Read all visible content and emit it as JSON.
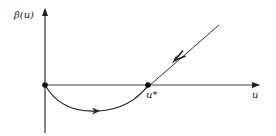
{
  "figure": {
    "type": "phase-diagram",
    "y_axis_label": "β(u)",
    "x_axis_label": "u",
    "fixed_point_label": "u*",
    "color": "#222222",
    "elements": [
      {
        "name": "origin-fixed-point",
        "kind": "dot",
        "at": "origin"
      },
      {
        "name": "u-star-fixed-point",
        "kind": "dot",
        "at": "u*"
      },
      {
        "name": "lower-trajectory",
        "kind": "curve",
        "from": "origin",
        "to": "u*",
        "direction": "rightward",
        "below_axis": true
      },
      {
        "name": "upper-trajectory",
        "kind": "line",
        "from": "upper-right",
        "to": "u*",
        "direction": "toward u*"
      }
    ]
  }
}
